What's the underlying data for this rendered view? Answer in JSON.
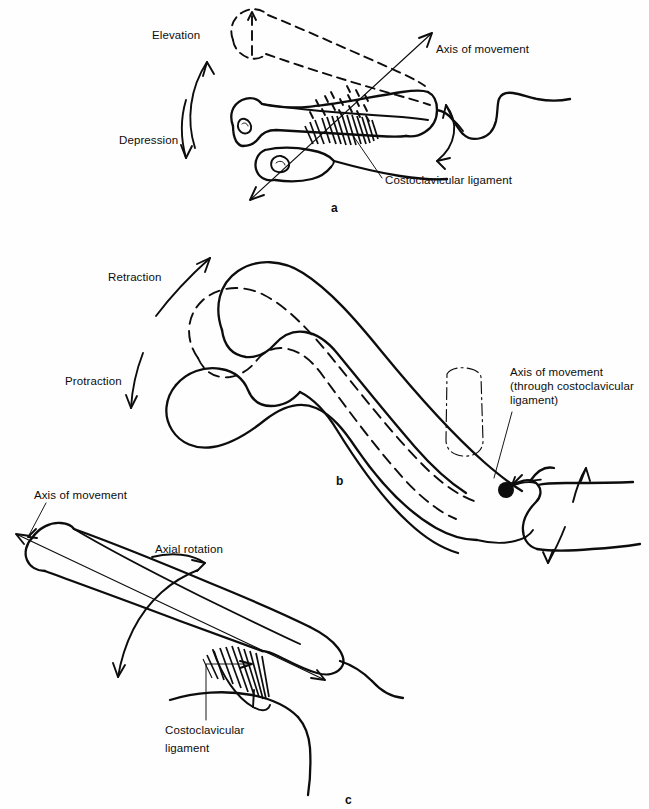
{
  "figure": {
    "background_color": "#fefefe",
    "ink_color": "#0d0d0d",
    "width": 649,
    "height": 809
  },
  "panels": [
    {
      "id": "a",
      "letter": "a",
      "caption": "Elevation and depression of the clavicle about an anteroposterior axis through the costoclavicular ligament",
      "labels": {
        "elevation": "Elevation",
        "depression": "Depression",
        "axis_of_movement": "Axis of movement",
        "costoclavicular_ligament": "Costoclavicular ligament"
      }
    },
    {
      "id": "b",
      "letter": "b",
      "caption": "Protraction and retraction of the clavicle about a vertical axis through the costoclavicular ligament",
      "labels": {
        "retraction": "Retraction",
        "protraction": "Protraction",
        "axis_of_movement_line1": "Axis of movement",
        "axis_of_movement_line2": "(through costoclavicular",
        "axis_of_movement_line3": "ligament)"
      }
    },
    {
      "id": "c",
      "letter": "c",
      "caption": "Axial rotation of the clavicle about its own long axis",
      "labels": {
        "axis_of_movement": "Axis of movement",
        "axial_rotation": "Axial rotation",
        "costoclavicular_line1": "Costoclavicular",
        "costoclavicular_line2": "ligament"
      }
    }
  ],
  "annotations": {
    "pivot_marker": "filled-circle",
    "dashed_outline_meaning": "displaced position of clavicle",
    "hatched_region_meaning": "costoclavicular ligament fibres"
  }
}
